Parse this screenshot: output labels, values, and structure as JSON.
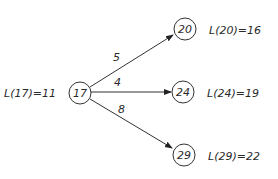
{
  "diagram": {
    "type": "directed-graph",
    "nodes": [
      {
        "id": "17",
        "label": "17",
        "annotation": "L(17)=11",
        "cx": 80,
        "cy": 93
      },
      {
        "id": "20",
        "label": "20",
        "annotation": "L(20)=16",
        "cx": 185,
        "cy": 29
      },
      {
        "id": "24",
        "label": "24",
        "annotation": "L(24)=19",
        "cx": 183,
        "cy": 92
      },
      {
        "id": "29",
        "label": "29",
        "annotation": "L(29)=22",
        "cx": 184,
        "cy": 155
      }
    ],
    "edges": [
      {
        "from": "17",
        "to": "20",
        "weight": "5"
      },
      {
        "from": "17",
        "to": "24",
        "weight": "4"
      },
      {
        "from": "17",
        "to": "29",
        "weight": "8"
      }
    ]
  }
}
